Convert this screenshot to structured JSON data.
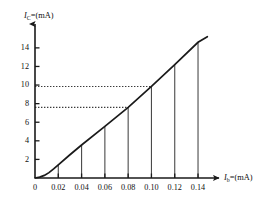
{
  "chart_data": {
    "type": "line",
    "title": "",
    "subtitle": "",
    "xlabel_parts": {
      "symbol": "I",
      "subscript": "b",
      "equals": "=",
      "unit": "(mA)"
    },
    "ylabel_parts": {
      "symbol": "I",
      "subscript": "C",
      "equals": "=",
      "unit": "(mA)"
    },
    "xlabel": "Ib=(mA)",
    "ylabel": "IC=(mA)",
    "xlim": [
      0,
      0.152
    ],
    "ylim": [
      0,
      15.6
    ],
    "grid": false,
    "legend": "none",
    "x_ticks": [
      0,
      0.02,
      0.04,
      0.06,
      0.08,
      0.1,
      0.12,
      0.14
    ],
    "x_tick_labels": [
      "0",
      "0.02",
      "0.04",
      "0.06",
      "0.08",
      "0.10",
      "0.12",
      "0.14"
    ],
    "y_ticks": [
      2,
      4,
      6,
      8,
      10,
      12,
      14
    ],
    "y_tick_labels": [
      "2",
      "4",
      "6",
      "8",
      "10",
      "12",
      "14"
    ],
    "series": [
      {
        "name": "transfer-characteristic",
        "color": "#1a1a1a",
        "x": [
          0.0,
          0.004,
          0.008,
          0.012,
          0.016,
          0.02,
          0.03,
          0.04,
          0.06,
          0.08,
          0.1,
          0.12,
          0.14,
          0.148
        ],
        "y": [
          0.0,
          0.1,
          0.28,
          0.58,
          0.98,
          1.42,
          2.5,
          3.55,
          5.55,
          7.6,
          9.85,
          12.2,
          14.6,
          15.2
        ]
      }
    ],
    "drop_lines": [
      {
        "x": 0.02,
        "y": 1.42
      },
      {
        "x": 0.04,
        "y": 3.55
      },
      {
        "x": 0.06,
        "y": 5.55
      },
      {
        "x": 0.08,
        "y": 7.6
      },
      {
        "x": 0.1,
        "y": 9.85
      },
      {
        "x": 0.12,
        "y": 12.2
      },
      {
        "x": 0.14,
        "y": 14.6
      }
    ],
    "guide_lines": [
      {
        "orientation": "horizontal",
        "y": 9.85,
        "x_from": 0,
        "x_to": 0.1,
        "label": "10"
      },
      {
        "orientation": "horizontal",
        "y": 7.6,
        "x_from": 0,
        "x_to": 0.08,
        "label": "8"
      }
    ],
    "axis_arrows": {
      "x": true,
      "y": true
    },
    "colors": {
      "ink": "#1a1a1a",
      "guide": "#3a3a3a",
      "drop": "#4a4a4a",
      "background": "#ffffff"
    }
  }
}
